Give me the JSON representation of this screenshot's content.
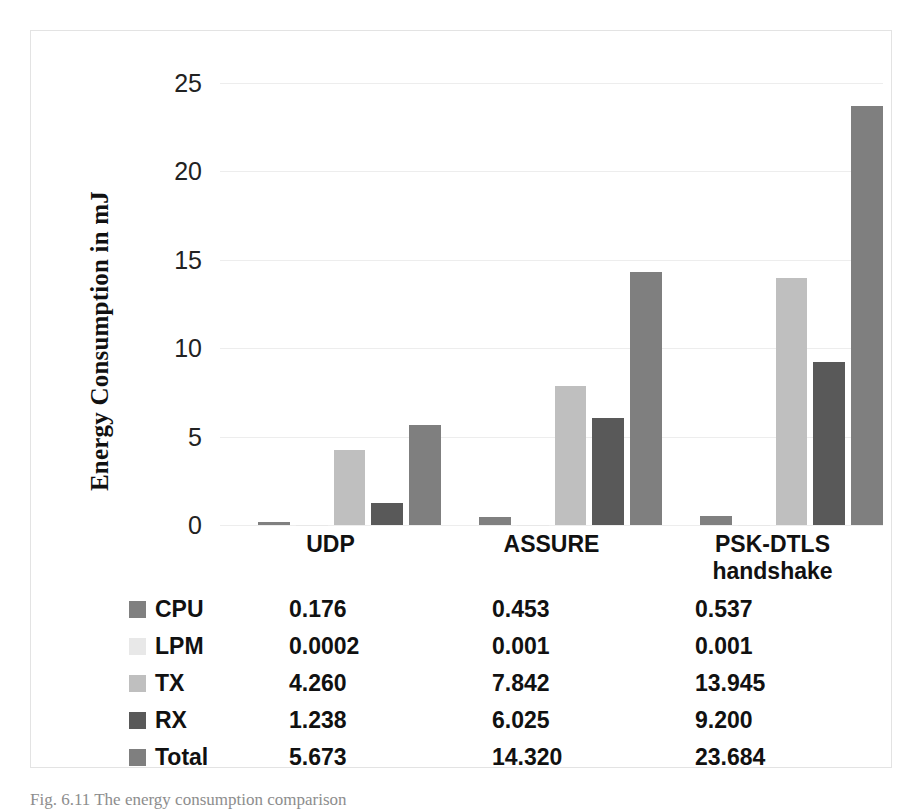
{
  "figure": {
    "caption": "Fig. 6.11 The energy consumption comparison"
  },
  "colors": {
    "cpu": "#808080",
    "lpm": "#e8e8e8",
    "tx": "#bfbfbf",
    "rx": "#595959",
    "total": "#7f7f7f",
    "gridline": "#ededed",
    "frame": "#e3e3e3",
    "text": "#111111"
  },
  "axis": {
    "y_title": "Energy Consumption in mJ",
    "y_ticks": [
      "0",
      "5",
      "10",
      "15",
      "20",
      "25"
    ]
  },
  "table": {
    "rows": [
      {
        "label": "CPU",
        "swatch": "cpu",
        "values": [
          "0.176",
          "0.453",
          "0.537"
        ]
      },
      {
        "label": "LPM",
        "swatch": "lpm",
        "values": [
          "0.0002",
          "0.001",
          "0.001"
        ]
      },
      {
        "label": "TX",
        "swatch": "tx",
        "values": [
          "4.260",
          "7.842",
          "13.945"
        ]
      },
      {
        "label": "RX",
        "swatch": "rx",
        "values": [
          "1.238",
          "6.025",
          "9.200"
        ]
      },
      {
        "label": "Total",
        "swatch": "total",
        "values": [
          "5.673",
          "14.320",
          "23.684"
        ]
      }
    ]
  },
  "chart_data": {
    "type": "bar",
    "title": "",
    "xlabel": "",
    "ylabel": "Energy Consumption in mJ",
    "ylim": [
      0,
      25
    ],
    "yticks": [
      0,
      5,
      10,
      15,
      20,
      25
    ],
    "grid": true,
    "legend": [
      "CPU",
      "LPM",
      "TX",
      "RX",
      "Total"
    ],
    "legend_position": "below-table",
    "categories": [
      "UDP",
      "ASSURE",
      "PSK-DTLS handshake"
    ],
    "series": [
      {
        "name": "CPU",
        "values": [
          0.176,
          0.453,
          0.537
        ]
      },
      {
        "name": "LPM",
        "values": [
          0.0002,
          0.001,
          0.001
        ]
      },
      {
        "name": "TX",
        "values": [
          4.26,
          7.842,
          13.945
        ]
      },
      {
        "name": "RX",
        "values": [
          1.238,
          6.025,
          9.2
        ]
      },
      {
        "name": "Total",
        "values": [
          5.673,
          14.32,
          23.684
        ]
      }
    ]
  }
}
